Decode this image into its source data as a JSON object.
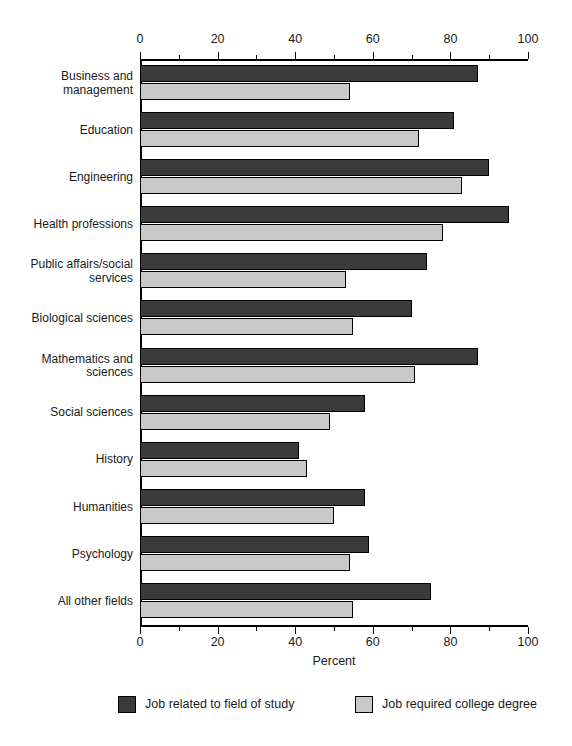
{
  "chart_data": {
    "type": "bar",
    "orientation": "horizontal",
    "title": "",
    "xlabel": "Percent",
    "ylabel": "",
    "xlim": [
      0,
      100
    ],
    "xticks": [
      0,
      20,
      40,
      60,
      80,
      100
    ],
    "xtick_labels": [
      "0",
      "20",
      "40",
      "60",
      "80",
      "100"
    ],
    "minor_tick_step": 10,
    "grid": false,
    "axis_positions": [
      "top",
      "bottom"
    ],
    "legend_position": "bottom",
    "categories": [
      "Business and management",
      "Education",
      "Engineering",
      "Health professions",
      "Public affairs/social services",
      "Biological sciences",
      "Mathematics and sciences",
      "Social sciences",
      "History",
      "Humanities",
      "Psychology",
      "All other fields"
    ],
    "category_lines": [
      [
        "Business and",
        "management"
      ],
      [
        "Education"
      ],
      [
        "Engineering"
      ],
      [
        "Health professions"
      ],
      [
        "Public affairs/social",
        "services"
      ],
      [
        "Biological sciences"
      ],
      [
        "Mathematics and",
        "sciences"
      ],
      [
        "Social sciences"
      ],
      [
        "History"
      ],
      [
        "Humanities"
      ],
      [
        "Psychology"
      ],
      [
        "All other fields"
      ]
    ],
    "series": [
      {
        "name": "Job related to field of study",
        "color": "#3b3b3b",
        "values": [
          87,
          81,
          90,
          95,
          74,
          70,
          87,
          58,
          41,
          58,
          59,
          75
        ]
      },
      {
        "name": "Job required college degree",
        "color": "#c9c9c9",
        "values": [
          54,
          72,
          83,
          78,
          53,
          55,
          71,
          49,
          43,
          50,
          54,
          55
        ]
      }
    ]
  },
  "legend": {
    "items": [
      {
        "label": "Job related to field of study",
        "swatch": "series0"
      },
      {
        "label": "Job required college degree",
        "swatch": "series1"
      }
    ]
  },
  "axis": {
    "x_title": "Percent"
  }
}
